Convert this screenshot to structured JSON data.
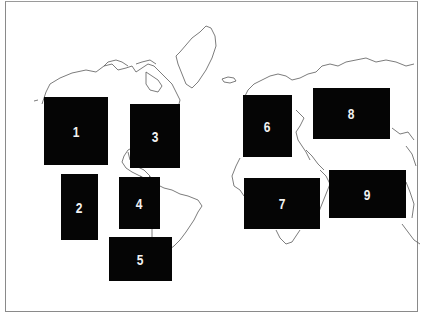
{
  "map": {
    "type": "world outline map (equirectangular, no labels)",
    "frame_color": "#8a8a8a",
    "coastline_color": "#5a5a5a",
    "box_color": "#050505",
    "label_color": "#f2f2f2"
  },
  "regions": [
    {
      "label": "1",
      "area": "North America (west/central)",
      "x": 44,
      "y": 97,
      "w": 64,
      "h": 68
    },
    {
      "label": "2",
      "area": "Mexico / Central America (Pacific)",
      "x": 61,
      "y": 174,
      "w": 37,
      "h": 66
    },
    {
      "label": "3",
      "area": "North America (east)",
      "x": 130,
      "y": 104,
      "w": 50,
      "h": 64
    },
    {
      "label": "4",
      "area": "South America (north)",
      "x": 119,
      "y": 177,
      "w": 41,
      "h": 52
    },
    {
      "label": "5",
      "area": "South America (south)",
      "x": 109,
      "y": 237,
      "w": 63,
      "h": 44
    },
    {
      "label": "6",
      "area": "Europe",
      "x": 243,
      "y": 95,
      "w": 49,
      "h": 62
    },
    {
      "label": "7",
      "area": "Africa",
      "x": 244,
      "y": 178,
      "w": 76,
      "h": 51
    },
    {
      "label": "8",
      "area": "Russia / Central Asia",
      "x": 313,
      "y": 88,
      "w": 77,
      "h": 51
    },
    {
      "label": "9",
      "area": "South / Southeast Asia",
      "x": 329,
      "y": 170,
      "w": 77,
      "h": 48
    }
  ]
}
